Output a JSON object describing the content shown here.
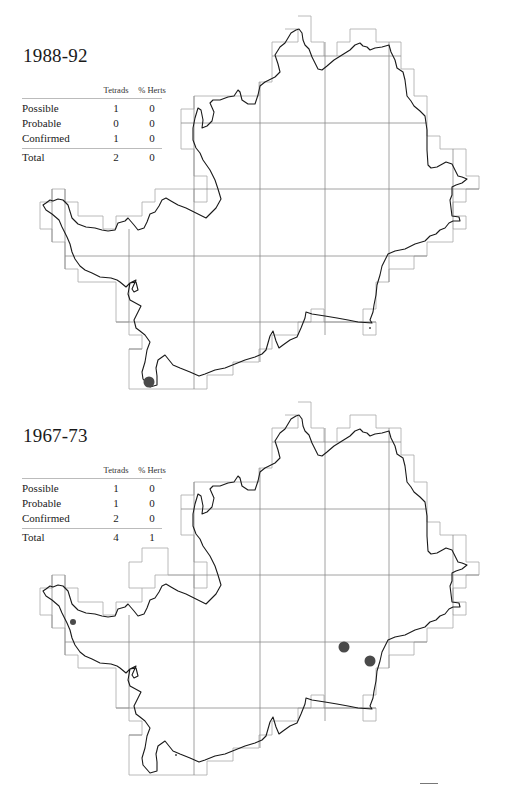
{
  "maps": [
    {
      "title": "1988-92",
      "table": {
        "headers": [
          "",
          "Tetrads",
          "% Herts"
        ],
        "rows": [
          {
            "label": "Possible",
            "tetrads": "1",
            "pct_herts": "0"
          },
          {
            "label": "Probable",
            "tetrads": "0",
            "pct_herts": "0"
          },
          {
            "label": "Confirmed",
            "tetrads": "1",
            "pct_herts": "0"
          }
        ],
        "total": {
          "label": "Total",
          "tetrads": "2",
          "pct_herts": "0"
        }
      },
      "dots": [
        {
          "x": 149,
          "y": 382,
          "r": 5.5,
          "status": "confirmed"
        },
        {
          "x": 370,
          "y": 328,
          "r": 1,
          "status": "possible"
        }
      ]
    },
    {
      "title": "1967-73",
      "table": {
        "headers": [
          "",
          "Tetrads",
          "% Herts"
        ],
        "rows": [
          {
            "label": "Possible",
            "tetrads": "1",
            "pct_herts": "0"
          },
          {
            "label": "Probable",
            "tetrads": "1",
            "pct_herts": "0"
          },
          {
            "label": "Confirmed",
            "tetrads": "2",
            "pct_herts": "0"
          }
        ],
        "total": {
          "label": "Total",
          "tetrads": "4",
          "pct_herts": "1"
        }
      },
      "dots": [
        {
          "x": 73,
          "y": 622,
          "r": 3,
          "status": "probable"
        },
        {
          "x": 344,
          "y": 647,
          "r": 5.5,
          "status": "confirmed"
        },
        {
          "x": 370,
          "y": 661,
          "r": 5.5,
          "status": "confirmed"
        },
        {
          "x": 176,
          "y": 755,
          "r": 1,
          "status": "possible"
        }
      ]
    }
  ],
  "colors": {
    "boundary": "#1a1a1a",
    "grid": "#8a8a8a",
    "tetrad_edge": "#a8a8a8",
    "dot": "#4a4a4a"
  }
}
